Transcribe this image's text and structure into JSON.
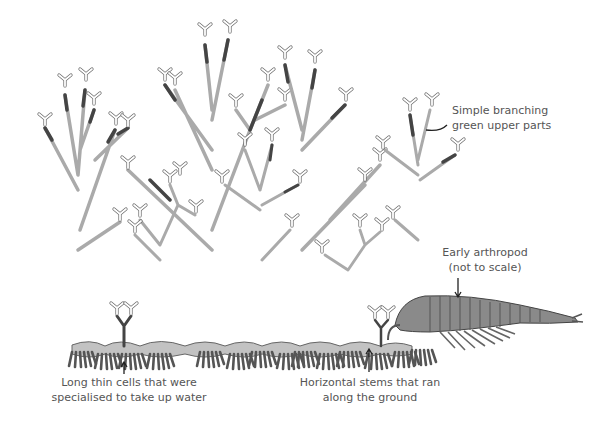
{
  "diagram": {
    "labels": {
      "upper_parts": {
        "line1": "Simple branching",
        "line2": "green upper parts"
      },
      "arthropod": {
        "line1": "Early arthropod",
        "line2": "(not to scale)"
      },
      "cells": {
        "line1": "Long thin cells that were",
        "line2": "specialised to take up water"
      },
      "stems": {
        "line1": "Horizontal stems that ran",
        "line2": "along the ground"
      }
    },
    "colors": {
      "stem_light": "#b5b5b5",
      "stem_dark": "#555555",
      "outline": "#444444",
      "ground": "#c4c4c4",
      "text": "#555555",
      "background": "#ffffff"
    }
  }
}
